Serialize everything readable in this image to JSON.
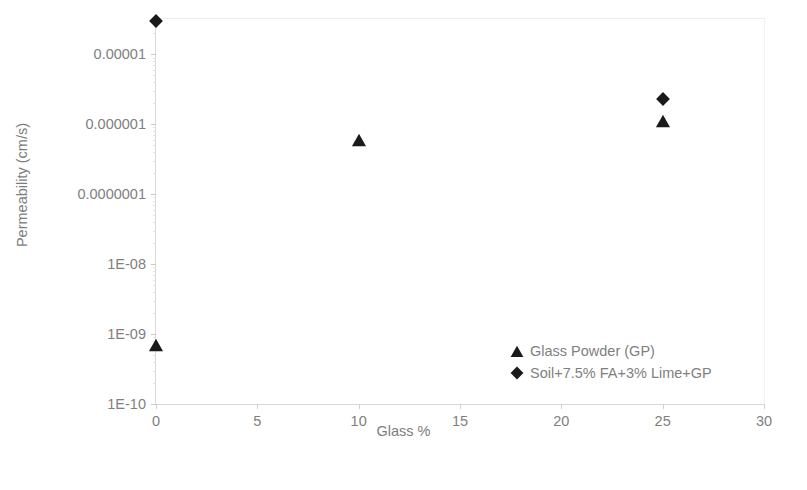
{
  "chart_data": {
    "type": "scatter",
    "title": "",
    "xlabel": "Glass %",
    "ylabel": "Permeability (cm/s)",
    "xlim": [
      0,
      30
    ],
    "ylim": [
      1e-10,
      3.2e-05
    ],
    "yscale": "log",
    "xscale": "linear",
    "grid": false,
    "legend_position": "inside-bottom-right",
    "xticks": [
      "0",
      "5",
      "10",
      "15",
      "20",
      "25",
      "30"
    ],
    "xtick_values": [
      0,
      5,
      10,
      15,
      20,
      25,
      30
    ],
    "yticks": [
      "0.00001",
      "0.000001",
      "0.0000001",
      "1E-08",
      "1E-09",
      "1E-10"
    ],
    "ytick_values": [
      1e-05,
      1e-06,
      1e-07,
      1e-08,
      1e-09,
      1e-10
    ],
    "series": [
      {
        "name": "Glass Powder (GP)",
        "marker": "triangle",
        "color": "#1a1a1a",
        "points": [
          {
            "x": 0,
            "y": 7e-10
          },
          {
            "x": 10,
            "y": 6e-07
          },
          {
            "x": 25,
            "y": 1.1e-06
          }
        ]
      },
      {
        "name": "Soil+7.5% FA+3% Lime+GP",
        "marker": "diamond",
        "color": "#1a1a1a",
        "points": [
          {
            "x": 0,
            "y": 3e-05
          },
          {
            "x": 25,
            "y": 2.3e-06
          }
        ]
      }
    ]
  },
  "legend": {
    "items": [
      {
        "label": "Glass Powder (GP)",
        "marker": "triangle-marker-icon"
      },
      {
        "label": "Soil+7.5% FA+3% Lime+GP",
        "marker": "diamond-marker-icon"
      }
    ]
  },
  "colors": {
    "marker": "#1a1a1a",
    "axis_text": "#7f7f7f",
    "axis_line": "#d9d9d9",
    "background": "#ffffff"
  }
}
